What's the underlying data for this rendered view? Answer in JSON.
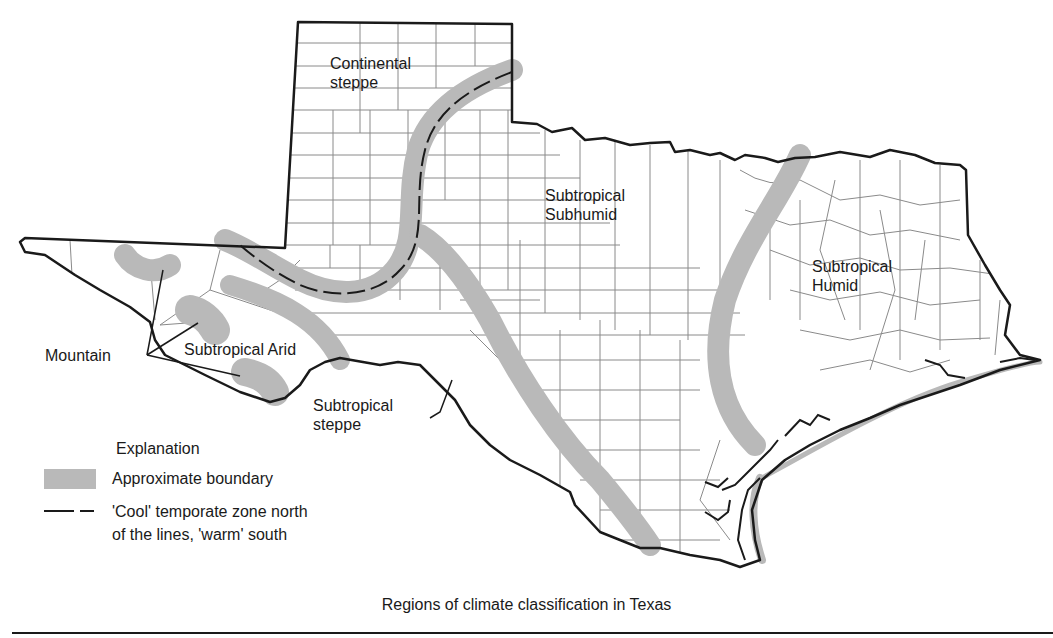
{
  "figure": {
    "title": "Regions of climate classification in Texas",
    "colors": {
      "boundary_band": "#b9b9b9",
      "state_outline": "#1a1a1a",
      "county_lines": "#8a8a8a",
      "background": "#ffffff"
    }
  },
  "regions": [
    {
      "id": "continental-steppe",
      "line1": "Continental",
      "line2": "steppe"
    },
    {
      "id": "subtropical-subhumid",
      "line1": "Subtropical",
      "line2": "Subhumid"
    },
    {
      "id": "subtropical-humid",
      "line1": "Subtropical",
      "line2": "Humid"
    },
    {
      "id": "subtropical-arid",
      "line1": "Subtropical Arid"
    },
    {
      "id": "subtropical-steppe",
      "line1": "Subtropical",
      "line2": "steppe"
    },
    {
      "id": "mountain",
      "line1": "Mountain"
    }
  ],
  "legend": {
    "title": "Explanation",
    "items": [
      {
        "symbol": "gray-band",
        "label": "Approximate boundary"
      },
      {
        "symbol": "dashed-line",
        "label": "'Cool' temporate zone north",
        "label2": "of the lines, 'warm' south"
      }
    ]
  }
}
